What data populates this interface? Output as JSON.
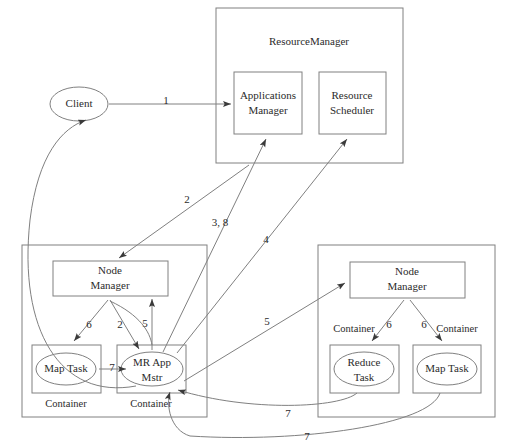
{
  "diagram": {
    "nodes": {
      "client": "Client",
      "resource_manager": "ResourceManager",
      "applications_manager": {
        "line1": "Applications",
        "line2": "Manager"
      },
      "resource_scheduler": {
        "line1": "Resource",
        "line2": "Scheduler"
      },
      "node_manager_left": {
        "line1": "Node",
        "line2": "Manager"
      },
      "node_manager_right": {
        "line1": "Node",
        "line2": "Manager"
      },
      "map_task_left": "Map Task",
      "mr_app_mstr": {
        "line1": "MR App",
        "line2": "Mstr"
      },
      "reduce_task": {
        "line1": "Reduce",
        "line2": "Task"
      },
      "map_task_right": "Map Task",
      "container_label": "Container"
    },
    "containers": {
      "left_map_task": "Container",
      "left_mr_app": "Container",
      "right_reduce_task": "Container",
      "right_map_task": "Container"
    },
    "edge_labels": {
      "client_to_apps_manager": "1",
      "apps_manager_to_node_manager_left": "2",
      "node_manager_to_mr_app": "2",
      "mr_app_to_apps_manager": "3, 8",
      "mr_app_to_scheduler": "4",
      "mr_app_to_node_manager_left": "5",
      "mr_app_to_node_manager_right": "5",
      "node_manager_to_map_task_left": "6",
      "node_manager_to_reduce_task": "6",
      "node_manager_to_map_task_right": "6",
      "map_task_to_mr_app": "7",
      "right_reduce_to_mr_app": "7",
      "right_map_to_mr_app": "7"
    },
    "colors": {
      "stroke": "#808080",
      "text": "#2b2b2b",
      "background": "#ffffff"
    }
  }
}
